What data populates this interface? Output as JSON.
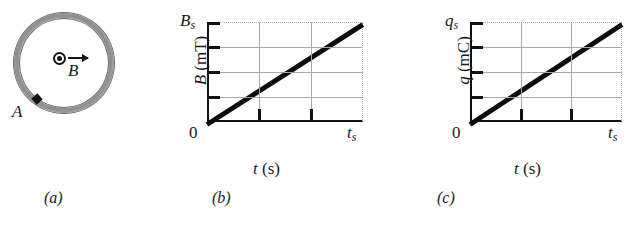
{
  "figure": {
    "panels": [
      {
        "id": "a",
        "caption": "(a)",
        "type": "diagram",
        "description": "conducting loop in uniform magnetic field out of page",
        "labels": {
          "point_a": "A",
          "field": "B",
          "field_direction_icon": "field-out-of-page-icon"
        },
        "colors": {
          "ring": "#9a9a9a",
          "ring_outline": "#6b6b6b",
          "marker": "#111111"
        }
      },
      {
        "id": "b",
        "caption": "(b)",
        "type": "chart"
      },
      {
        "id": "c",
        "caption": "(c)",
        "type": "chart"
      }
    ]
  },
  "chart_data": [
    {
      "panel": "b",
      "type": "line",
      "title": "",
      "xlabel": "t (s)",
      "ylabel": "B (mT)",
      "ylabel_symbol": "B",
      "ylabel_unit": "(mT)",
      "xlabel_symbol": "t",
      "xlabel_unit": "(s)",
      "x_origin_tick": "0",
      "x_max_tick": "t",
      "x_max_tick_sub": "s",
      "y_max_tick": "B",
      "y_max_tick_sub": "s",
      "xlim": [
        0,
        1
      ],
      "ylim": [
        0,
        1
      ],
      "x": [
        0,
        1
      ],
      "values": [
        0,
        1
      ],
      "grid": true,
      "grid_x_divisions": 3,
      "grid_y_divisions": 4,
      "legend": "none",
      "line_color": "#0d0d0d",
      "grid_color": "#a8a8a8"
    },
    {
      "panel": "c",
      "type": "line",
      "title": "",
      "xlabel": "t (s)",
      "ylabel": "q (mC)",
      "ylabel_symbol": "q",
      "ylabel_unit": "(mC)",
      "xlabel_symbol": "t",
      "xlabel_unit": "(s)",
      "x_origin_tick": "0",
      "x_max_tick": "t",
      "x_max_tick_sub": "s",
      "y_max_tick": "q",
      "y_max_tick_sub": "s",
      "xlim": [
        0,
        1
      ],
      "ylim": [
        0,
        1
      ],
      "x": [
        0,
        1
      ],
      "values": [
        0,
        1
      ],
      "grid": true,
      "grid_x_divisions": 3,
      "grid_y_divisions": 4,
      "legend": "none",
      "line_color": "#0d0d0d",
      "grid_color": "#a8a8a8"
    }
  ]
}
